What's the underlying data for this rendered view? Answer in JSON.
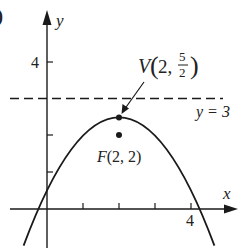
{
  "figure": {
    "panel_label_fragment": ")",
    "axes": {
      "x_label": "x",
      "y_label": "y",
      "x_tick_label": "4",
      "y_tick_label": "4",
      "x_ticks": [
        1,
        2,
        3,
        4
      ],
      "y_ticks": [
        1,
        2,
        3,
        4
      ]
    },
    "parabola": {
      "equation": "y = 5/2 - (x-2)^2/2",
      "vertex": [
        2,
        2.5
      ],
      "focus": [
        2,
        2
      ],
      "directrix_y": 3
    },
    "labels": {
      "vertex_V": "V",
      "vertex_coords_open": "(2, ",
      "vertex_frac_num": "5",
      "vertex_frac_den": "2",
      "vertex_close": ")",
      "focus": "F(2, 2)",
      "directrix": "y = 3"
    },
    "colors": {
      "ink": "#1a1a1a",
      "background": "#ffffff"
    }
  }
}
